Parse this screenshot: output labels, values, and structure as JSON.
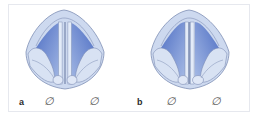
{
  "figure": {
    "panels": [
      {
        "id": "a",
        "label": "a",
        "markers": [
          "∅",
          "∅"
        ],
        "description": "vocal folds symmetric near midline"
      },
      {
        "id": "b",
        "label": "b",
        "markers": [
          "∅",
          "∅"
        ],
        "description": "vocal folds asymmetric, right fold displaced laterally"
      }
    ],
    "colors": {
      "shell": "#cdd9ef",
      "shell_inner": "#b9c9e9",
      "glottis_dark": "#4f6fc4",
      "glottis_light": "#a9bde6",
      "outline": "#7f8fb5",
      "fold": "#e3ebf8"
    }
  }
}
